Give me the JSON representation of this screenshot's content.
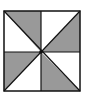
{
  "diagram": {
    "type": "pinwheel-square",
    "square": {
      "x": 4,
      "y": 11,
      "width": 76,
      "height": 80
    },
    "center": {
      "x": 41,
      "y": 52
    },
    "colors": {
      "shaded": "#999999",
      "unshaded": "#ffffff",
      "stroke": "#111111"
    },
    "triangles": [
      {
        "name": "top-left-upper",
        "shaded": true
      },
      {
        "name": "top-left-lower",
        "shaded": false
      },
      {
        "name": "top-right-upper",
        "shaded": false
      },
      {
        "name": "top-right-lower",
        "shaded": true
      },
      {
        "name": "bottom-left-upper",
        "shaded": true
      },
      {
        "name": "bottom-left-lower",
        "shaded": false
      },
      {
        "name": "bottom-right-upper",
        "shaded": true
      },
      {
        "name": "bottom-right-lower",
        "shaded": false
      }
    ]
  }
}
